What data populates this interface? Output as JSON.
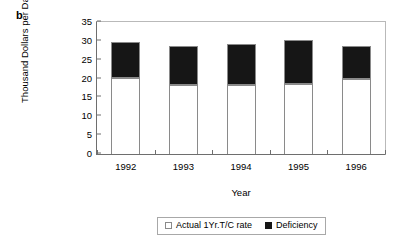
{
  "panel": {
    "label": "b"
  },
  "chart_data": {
    "type": "bar",
    "subtype": "stacked-vertical",
    "title": "",
    "xlabel": "Year",
    "ylabel": "Thousand Dollars per Day",
    "categories": [
      "1992",
      "1993",
      "1994",
      "1995",
      "1996"
    ],
    "ylim": [
      0,
      35
    ],
    "ytick_step": 5,
    "yticks": [
      "35",
      "30",
      "25",
      "20",
      "15",
      "10",
      "5",
      "0"
    ],
    "ytick_values": [
      35,
      30,
      25,
      20,
      15,
      10,
      5,
      0
    ],
    "grid": false,
    "legend_position": "below-center",
    "series": [
      {
        "name": "Actual 1Yr.T/C rate",
        "color": "#ffffff",
        "swatch": "white-square",
        "values": [
          20.2,
          18.3,
          18.2,
          18.5,
          20.0
        ]
      },
      {
        "name": "Deficiency",
        "color": "#161616",
        "swatch": "black-square",
        "values": [
          9.5,
          10.4,
          11.1,
          11.8,
          8.7
        ]
      }
    ],
    "totals": [
      29.7,
      28.7,
      29.3,
      30.3,
      28.7
    ]
  }
}
